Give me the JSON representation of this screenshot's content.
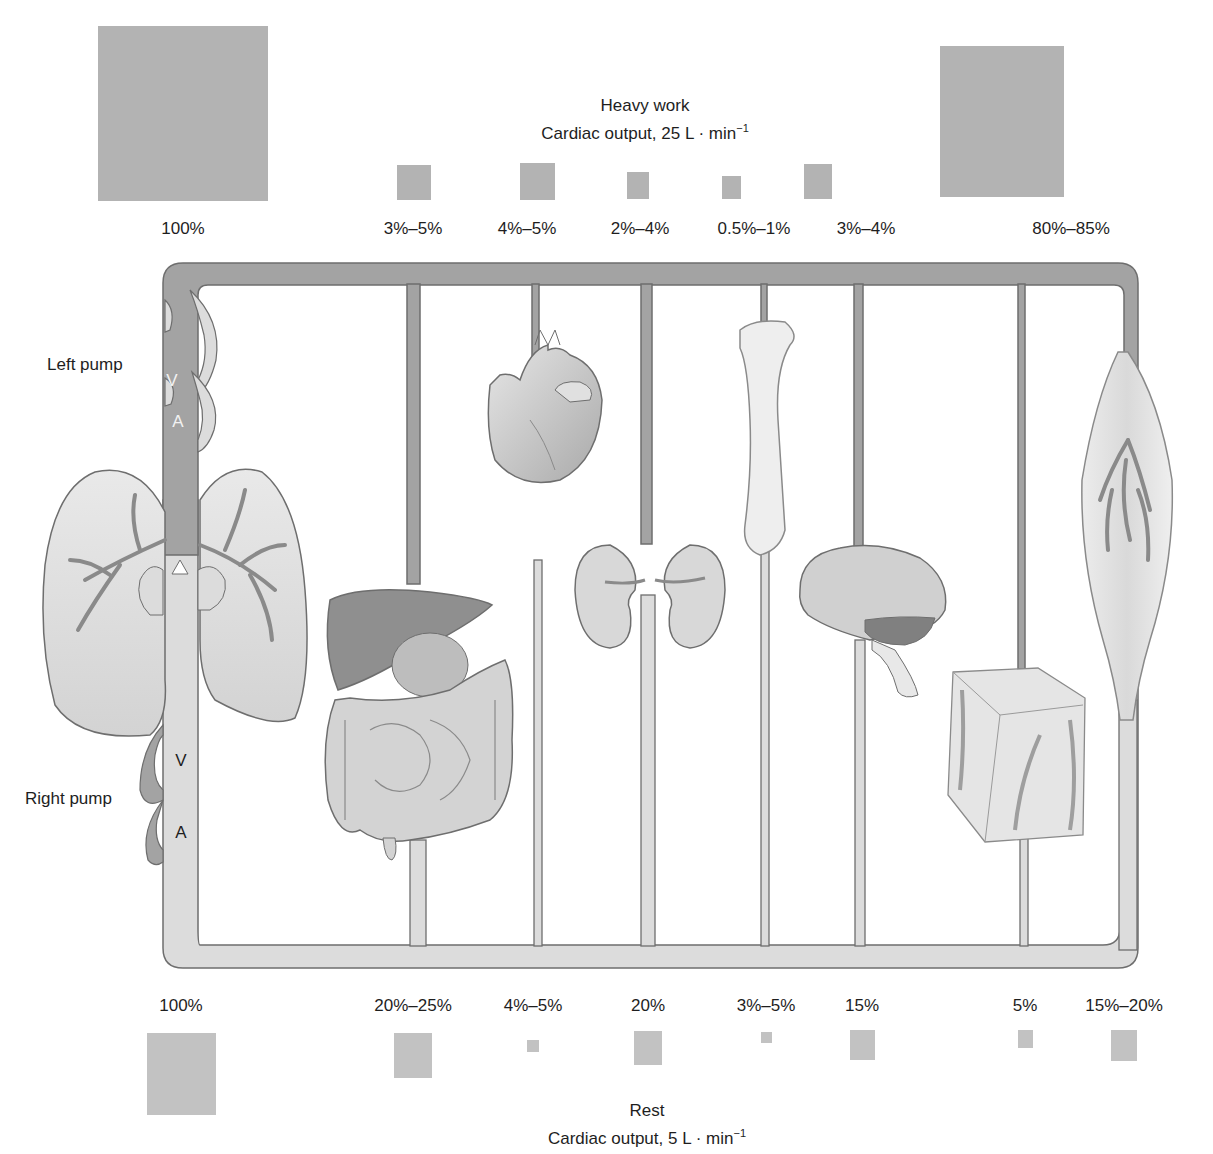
{
  "heavy_work": {
    "title": "Heavy work",
    "subtitle_prefix": "Cardiac output, 25 L · min",
    "subtitle_sup": "−1",
    "items": [
      {
        "label": "100%",
        "x": 183,
        "sq": [
          98,
          26,
          170,
          175
        ]
      },
      {
        "label": "3%–5%",
        "x": 413,
        "sq": [
          397,
          165,
          34,
          35
        ]
      },
      {
        "label": "4%–5%",
        "x": 527,
        "sq": [
          520,
          163,
          35,
          37
        ]
      },
      {
        "label": "2%–4%",
        "x": 640,
        "sq": [
          627,
          172,
          22,
          27
        ]
      },
      {
        "label": "0.5%–1%",
        "x": 754,
        "sq": [
          722,
          176,
          19,
          23
        ]
      },
      {
        "label": "3%–4%",
        "x": 866,
        "sq": [
          804,
          164,
          28,
          35
        ]
      },
      {
        "label": "80%–85%",
        "x": 1071,
        "sq": [
          940,
          46,
          124,
          151
        ]
      }
    ]
  },
  "rest": {
    "title": "Rest",
    "subtitle_prefix": "Cardiac output, 5 L · min",
    "subtitle_sup": "−1",
    "items": [
      {
        "label": "100%",
        "x": 181,
        "sq": [
          117,
          53,
          69,
          82
        ]
      },
      {
        "label": "20%–25%",
        "x": 413,
        "sq": [
          341,
          52,
          38,
          45
        ]
      },
      {
        "label": "4%–5%",
        "x": 533,
        "sq": [
          460,
          59,
          12,
          12
        ]
      },
      {
        "label": "20%",
        "x": 648,
        "sq": [
          27,
          51,
          28,
          34
        ]
      },
      {
        "label": "3%–5%",
        "x": 766,
        "sq": [
          137,
          52,
          11,
          11
        ]
      },
      {
        "label": "15%",
        "x": 862,
        "sq": [
          210,
          50,
          25,
          30
        ]
      },
      {
        "label": "5%",
        "x": 1025,
        "sq": [
          355,
          49,
          15,
          18
        ]
      },
      {
        "label": "15%–20%",
        "x": 1124,
        "sq": [
          442,
          49,
          26,
          31
        ]
      }
    ]
  },
  "pumps": {
    "left": {
      "label": "Left pump",
      "ventricle": "V",
      "atrium": "A"
    },
    "right": {
      "label": "Right pump",
      "ventricle": "V",
      "atrium": "A"
    }
  },
  "organs": [
    "lungs",
    "liver-and-intestines",
    "heart",
    "kidneys",
    "bone",
    "brain",
    "skin",
    "skeletal-muscle"
  ],
  "colors": {
    "arterial": "#a3a3a3",
    "venous": "#dcdcdc",
    "outline": "#6e6e6e",
    "square_heavy": "#b3b3b3",
    "square_rest": "#c2c2c2"
  }
}
